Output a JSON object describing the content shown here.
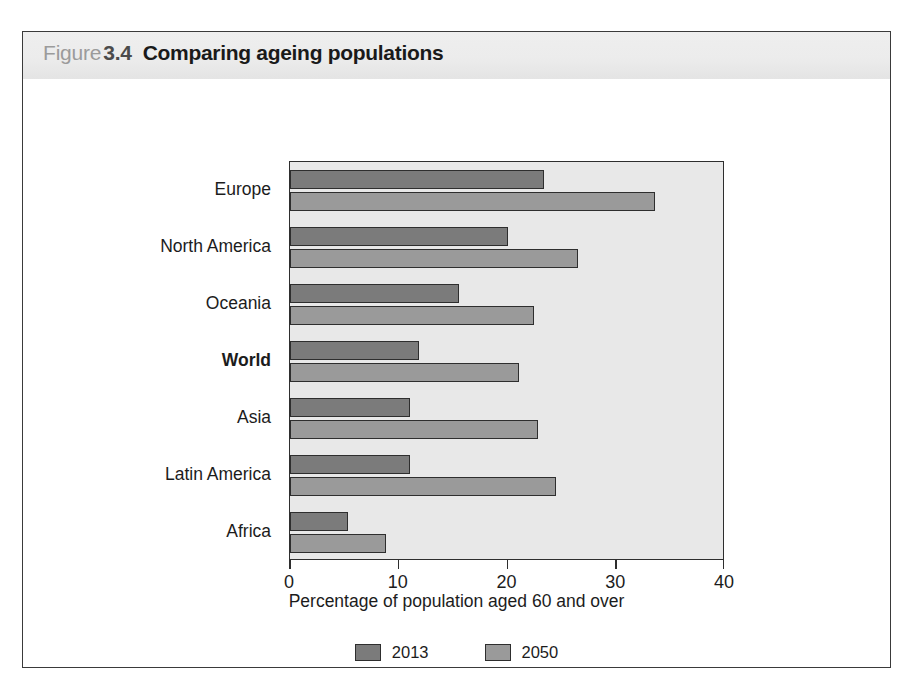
{
  "figure": {
    "label_word": "Figure",
    "number": "3.4",
    "title": "Comparing ageing populations"
  },
  "source_note": "",
  "colors": {
    "series_2013": "#7b7b7b",
    "series_2050": "#9a9a9a",
    "plot_background": "#e8e8e8",
    "header_background": "#ececec",
    "axis": "#2e2e2e"
  },
  "chart_data": {
    "type": "bar",
    "orientation": "horizontal",
    "title": "Comparing ageing populations",
    "xlabel": "Percentage of population aged 60 and over",
    "ylabel": "",
    "xlim": [
      0,
      40
    ],
    "xticks": [
      "0",
      "10",
      "20",
      "30",
      "40"
    ],
    "grid": false,
    "legend_position": "bottom",
    "categories": [
      "Europe",
      "North America",
      "Oceania",
      "World",
      "Asia",
      "Latin America",
      "Africa"
    ],
    "emphasized_category": "World",
    "series": [
      {
        "name": "2013",
        "color": "#7b7b7b",
        "values": [
          23.4,
          20.0,
          15.5,
          11.9,
          11.0,
          11.0,
          5.3
        ]
      },
      {
        "name": "2050",
        "color": "#9a9a9a",
        "values": [
          33.6,
          26.5,
          22.4,
          21.1,
          22.8,
          24.5,
          8.8
        ]
      }
    ]
  }
}
